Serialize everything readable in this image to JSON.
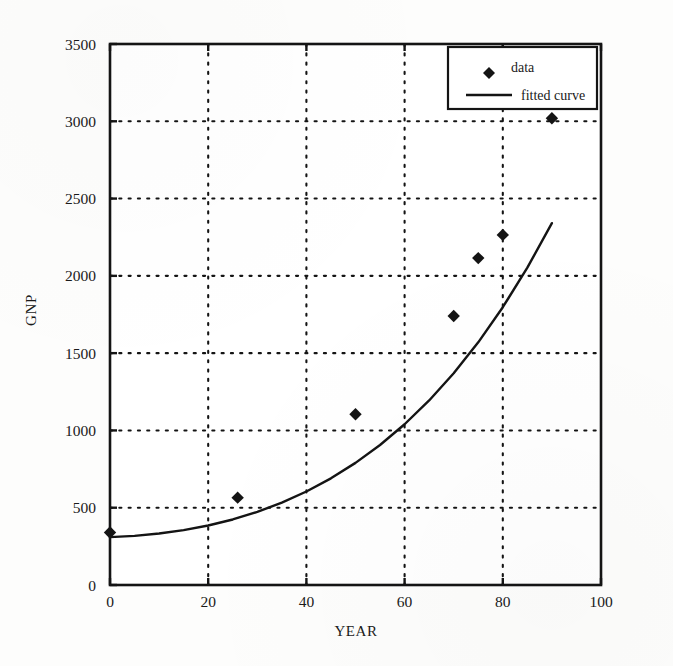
{
  "figure": {
    "background_color": "#fdfdfc",
    "ink_color": "#141414"
  },
  "chart_data": {
    "type": "scatter",
    "title": "",
    "subtitle": "",
    "xlabel": "YEAR",
    "ylabel": "GNP",
    "xlim": [
      0,
      100
    ],
    "ylim": [
      0,
      3500
    ],
    "xticks": [
      0,
      20,
      40,
      60,
      80,
      100
    ],
    "xtick_labels": [
      "0",
      "20",
      "40",
      "60",
      "80",
      "100"
    ],
    "yticks": [
      0,
      500,
      1000,
      1500,
      2000,
      2500,
      3000,
      3500
    ],
    "ytick_labels": [
      "0",
      "500",
      "1000",
      "1500",
      "2000",
      "2500",
      "3000",
      "3500"
    ],
    "grid": true,
    "grid_style": "dotted",
    "legend_position": "upper right",
    "series": [
      {
        "name": "data",
        "type": "scatter",
        "marker": "diamond",
        "color": "#141414",
        "x": [
          0,
          26,
          50,
          70,
          75,
          80,
          90
        ],
        "y": [
          340,
          565,
          1105,
          1740,
          2115,
          2265,
          3020
        ]
      },
      {
        "name": "fitted curve",
        "type": "line",
        "color": "#141414",
        "x": [
          0,
          5,
          10,
          15,
          20,
          25,
          30,
          35,
          40,
          45,
          50,
          55,
          60,
          65,
          70,
          75,
          80,
          85,
          90
        ],
        "y": [
          310,
          318,
          333,
          355,
          385,
          424,
          473,
          533,
          605,
          690,
          790,
          906,
          1040,
          1194,
          1370,
          1570,
          1797,
          2053,
          2341
        ]
      }
    ]
  },
  "legend": {
    "entries": [
      {
        "label": "data",
        "marker": "diamond"
      },
      {
        "label": "fitted curve",
        "marker": "line"
      }
    ]
  },
  "axes": {
    "x_title": "YEAR",
    "y_title": "GNP"
  }
}
